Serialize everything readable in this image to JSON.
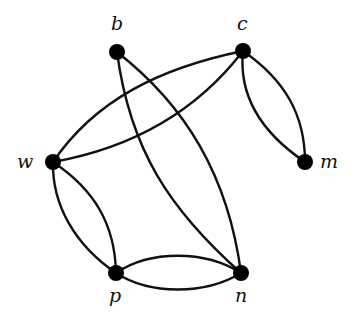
{
  "diagram": {
    "type": "multigraph",
    "colors": {
      "edge": "#111111",
      "node": "#000000",
      "background": "#ffffff"
    },
    "nodes": [
      {
        "id": "b",
        "label": "b",
        "x": 117,
        "y": 52
      },
      {
        "id": "c",
        "label": "c",
        "x": 243,
        "y": 51
      },
      {
        "id": "w",
        "label": "w",
        "x": 53,
        "y": 162
      },
      {
        "id": "m",
        "label": "m",
        "x": 305,
        "y": 162
      },
      {
        "id": "p",
        "label": "p",
        "x": 116,
        "y": 273
      },
      {
        "id": "n",
        "label": "n",
        "x": 241,
        "y": 273
      }
    ],
    "edges": [
      {
        "from": "w",
        "to": "c",
        "multiplicity_index": 1
      },
      {
        "from": "w",
        "to": "c",
        "multiplicity_index": 2
      },
      {
        "from": "c",
        "to": "m",
        "multiplicity_index": 1
      },
      {
        "from": "c",
        "to": "m",
        "multiplicity_index": 2
      },
      {
        "from": "b",
        "to": "n",
        "multiplicity_index": 1
      },
      {
        "from": "b",
        "to": "n",
        "multiplicity_index": 2
      },
      {
        "from": "w",
        "to": "p",
        "multiplicity_index": 1
      },
      {
        "from": "w",
        "to": "p",
        "multiplicity_index": 2
      },
      {
        "from": "p",
        "to": "n",
        "multiplicity_index": 1
      },
      {
        "from": "p",
        "to": "n",
        "multiplicity_index": 2
      }
    ]
  }
}
